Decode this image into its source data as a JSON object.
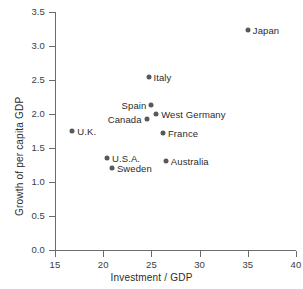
{
  "chart_data": {
    "type": "scatter",
    "title": "",
    "xlabel": "Investment / GDP",
    "ylabel": "Growth of per capita GDP",
    "xlim": [
      15,
      40
    ],
    "ylim": [
      0.0,
      3.5
    ],
    "xticks": [
      "15",
      "20",
      "25",
      "30",
      "35",
      "40"
    ],
    "yticks": [
      "0.0",
      "0.5",
      "1.0",
      "1.5",
      "2.0",
      "2.5",
      "3.0",
      "3.5"
    ],
    "grid": false,
    "legend": "none",
    "marker_color": "#585858",
    "axis_color": "#6b6b6b",
    "points": [
      {
        "label": "Japan",
        "x": 35.0,
        "y": 3.23,
        "side": "right"
      },
      {
        "label": "Italy",
        "x": 24.7,
        "y": 2.55,
        "side": "right"
      },
      {
        "label": "Spain",
        "x": 25.0,
        "y": 2.13,
        "side": "left"
      },
      {
        "label": "West Germany",
        "x": 25.5,
        "y": 2.0,
        "side": "right"
      },
      {
        "label": "Canada",
        "x": 24.5,
        "y": 1.93,
        "side": "left"
      },
      {
        "label": "U.K.",
        "x": 16.8,
        "y": 1.75,
        "side": "right"
      },
      {
        "label": "France",
        "x": 26.2,
        "y": 1.72,
        "side": "right"
      },
      {
        "label": "U.S.A.",
        "x": 20.4,
        "y": 1.35,
        "side": "right"
      },
      {
        "label": "Australia",
        "x": 26.5,
        "y": 1.31,
        "side": "right"
      },
      {
        "label": "Sweden",
        "x": 20.9,
        "y": 1.2,
        "side": "right"
      }
    ]
  }
}
